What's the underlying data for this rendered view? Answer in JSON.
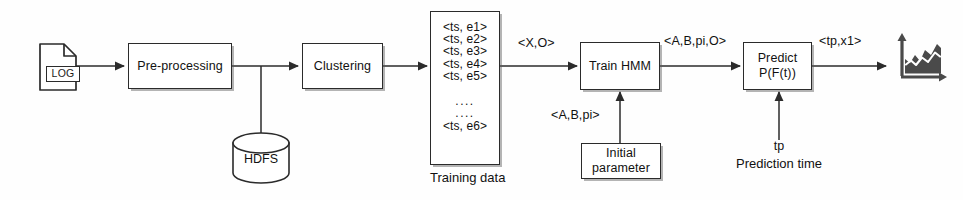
{
  "figure": {
    "stroke_color": "#2b2b2b",
    "text_color": "#111111",
    "background_color": "#fefefe",
    "icon_fill": "#4a4a4a"
  },
  "nodes": {
    "log_source": {
      "icon_name": "log-document-icon",
      "label": "LOG"
    },
    "preprocessing": {
      "label": "Pre-processing"
    },
    "hdfs": {
      "icon_name": "database-cylinder-icon",
      "label": "HDFS"
    },
    "clustering": {
      "label": "Clustering"
    },
    "training_data": {
      "caption": "Training data",
      "rows": [
        "<ts, e1>",
        "<ts, e2>",
        "<ts, e3>",
        "<ts, e4>",
        "<ts, e5>"
      ],
      "dots": [
        "....",
        "...."
      ],
      "last_row": "<ts, e6>"
    },
    "train_hmm": {
      "label": "Train HMM"
    },
    "initial_parameter": {
      "label_line1": "Initial",
      "label_line2": "parameter"
    },
    "predict": {
      "label_line1": "Predict",
      "label_line2": "P(F(t))"
    },
    "result_chart": {
      "icon_name": "area-chart-icon"
    }
  },
  "edge_labels": {
    "clustering_to_train": "<X,O>",
    "train_to_predict": "<A,B,pi,O>",
    "initial_to_train": "<A,B,pi>",
    "predict_to_chart": "<tp,x1>",
    "prediction_time_symbol": "tp",
    "prediction_time_caption": "Prediction time"
  }
}
